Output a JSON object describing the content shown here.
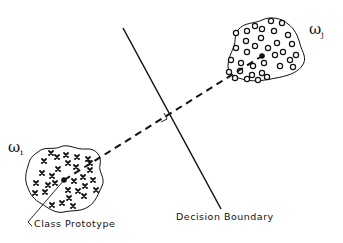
{
  "diagram": {
    "type": "minimum-distance classifier illustration",
    "classes": [
      {
        "id": "i",
        "label": "ω",
        "subscript": "i",
        "marker": "x",
        "count": 30
      },
      {
        "id": "j",
        "label": "ω",
        "subscript": "j",
        "marker": "o",
        "count": 34
      }
    ],
    "annotations": {
      "prototype_label": "Class Prototype",
      "boundary_label": "Decision Boundary"
    },
    "elements": {
      "boundary_line": "solid",
      "prototype_connector": "dashed",
      "perpendicular_marker": "right-angle"
    }
  }
}
